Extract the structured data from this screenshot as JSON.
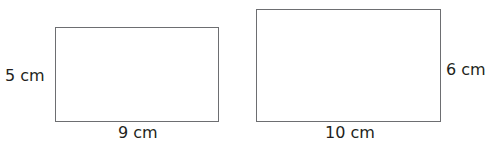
{
  "shapes": [
    {
      "name": "rectangle-a",
      "width_label": "9 cm",
      "height_label": "5 cm"
    },
    {
      "name": "rectangle-b",
      "width_label": "10 cm",
      "height_label": "6 cm"
    }
  ],
  "colors": {
    "stroke": "#6d6e71",
    "text": "#231f20",
    "background": "#ffffff"
  }
}
